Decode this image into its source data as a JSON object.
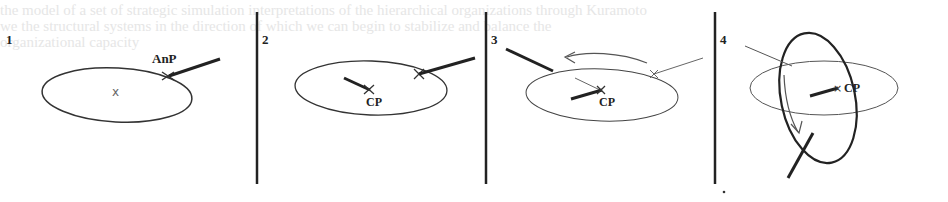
{
  "panels": [
    {
      "number": "1",
      "label": "AnP",
      "center_mark": "x"
    },
    {
      "number": "2",
      "label": "CP"
    },
    {
      "number": "3",
      "label": "CP"
    },
    {
      "number": "4",
      "label": "CP"
    }
  ],
  "ghost_text": {
    "line1": "the model of a set of strategic simulation interpretations of the hierarchical organizations through Kuramoto",
    "line2": "we the structural systems in the direction of which we can begin to stabilize and balance the",
    "line3": "organizational capacity"
  },
  "colors": {
    "ink": "#222222",
    "light_ink": "#555555",
    "ghost": "#e6e6e6"
  }
}
